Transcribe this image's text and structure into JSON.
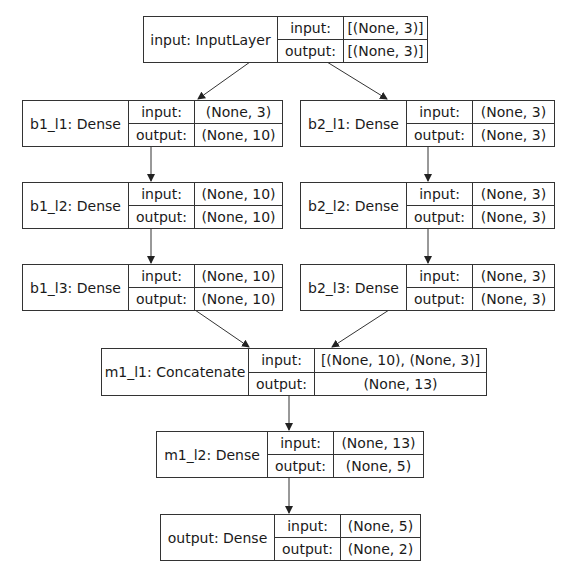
{
  "diagram": {
    "type": "keras-model-plot",
    "nodes": [
      {
        "id": "input",
        "name": "input: InputLayer",
        "input_label": "input:",
        "input_value": "[(None, 3)]",
        "output_label": "output:",
        "output_value": "[(None, 3)]"
      },
      {
        "id": "b1_l1",
        "name": "b1_l1: Dense",
        "input_label": "input:",
        "input_value": "(None, 3)",
        "output_label": "output:",
        "output_value": "(None, 10)"
      },
      {
        "id": "b2_l1",
        "name": "b2_l1: Dense",
        "input_label": "input:",
        "input_value": "(None, 3)",
        "output_label": "output:",
        "output_value": "(None, 3)"
      },
      {
        "id": "b1_l2",
        "name": "b1_l2: Dense",
        "input_label": "input:",
        "input_value": "(None, 10)",
        "output_label": "output:",
        "output_value": "(None, 10)"
      },
      {
        "id": "b2_l2",
        "name": "b2_l2: Dense",
        "input_label": "input:",
        "input_value": "(None, 3)",
        "output_label": "output:",
        "output_value": "(None, 3)"
      },
      {
        "id": "b1_l3",
        "name": "b1_l3: Dense",
        "input_label": "input:",
        "input_value": "(None, 10)",
        "output_label": "output:",
        "output_value": "(None, 10)"
      },
      {
        "id": "b2_l3",
        "name": "b2_l3: Dense",
        "input_label": "input:",
        "input_value": "(None, 3)",
        "output_label": "output:",
        "output_value": "(None, 3)"
      },
      {
        "id": "m1_l1",
        "name": "m1_l1: Concatenate",
        "input_label": "input:",
        "input_value": "[(None, 10), (None, 3)]",
        "output_label": "output:",
        "output_value": "(None, 13)"
      },
      {
        "id": "m1_l2",
        "name": "m1_l2: Dense",
        "input_label": "input:",
        "input_value": "(None, 13)",
        "output_label": "output:",
        "output_value": "(None, 5)"
      },
      {
        "id": "output",
        "name": "output: Dense",
        "input_label": "input:",
        "input_value": "(None, 5)",
        "output_label": "output:",
        "output_value": "(None, 2)"
      }
    ],
    "edges": [
      {
        "from": "input",
        "to": "b1_l1"
      },
      {
        "from": "input",
        "to": "b2_l1"
      },
      {
        "from": "b1_l1",
        "to": "b1_l2"
      },
      {
        "from": "b2_l1",
        "to": "b2_l2"
      },
      {
        "from": "b1_l2",
        "to": "b1_l3"
      },
      {
        "from": "b2_l2",
        "to": "b2_l3"
      },
      {
        "from": "b1_l3",
        "to": "m1_l1"
      },
      {
        "from": "b2_l3",
        "to": "m1_l1"
      },
      {
        "from": "m1_l1",
        "to": "m1_l2"
      },
      {
        "from": "m1_l2",
        "to": "output"
      }
    ],
    "colors": {
      "line": "#333333",
      "background": "#ffffff",
      "text": "#1a1a1a"
    }
  }
}
